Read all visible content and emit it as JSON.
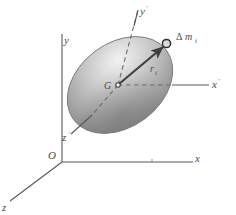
{
  "figure": {
    "background_color": "#ffffff",
    "line_color": "#4a4a4a",
    "body_fill_light": "#e8e8e8",
    "body_fill_dark": "#8a8a8a",
    "body_outline": "#6b6b6b"
  },
  "labels": {
    "origin": "O",
    "axis_x": "x",
    "axis_y": "y",
    "axis_z": "z",
    "axis_x_prime": "x",
    "axis_x_prime_mark": "'",
    "axis_y_prime": "y",
    "axis_y_prime_mark": "'",
    "axis_z_prime": "z",
    "axis_z_prime_mark": "'",
    "center_of_mass": "G",
    "position_vector": "r",
    "position_vector_sub": "i",
    "mass_element_delta": "Δ",
    "mass_element_m": "m",
    "mass_element_sub": "i"
  },
  "geometry": {
    "origin_point": [
      62,
      162
    ],
    "x_axis_end": [
      193,
      162
    ],
    "y_axis_top": [
      62,
      34
    ],
    "z_axis_end": [
      8,
      203
    ],
    "center_of_mass_point": [
      118,
      85
    ],
    "mass_element_point": [
      166,
      43
    ],
    "x_prime_end": [
      210,
      85
    ],
    "y_prime_top": [
      138,
      8
    ],
    "z_prime_end": [
      72,
      133
    ]
  }
}
